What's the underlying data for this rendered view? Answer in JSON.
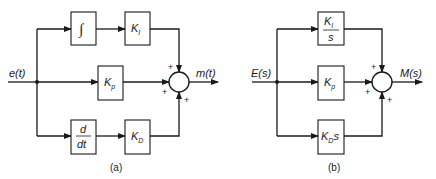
{
  "diagram_a": {
    "caption": "(a)",
    "input_label": "e(t)",
    "output_label": "m(t)",
    "blocks": {
      "integral": {
        "symbol": "∫"
      },
      "ki": {
        "main": "K",
        "sub": "I"
      },
      "kp": {
        "main": "K",
        "sub": "p"
      },
      "derivative": {
        "num": "d",
        "den": "dt"
      },
      "kd": {
        "main": "K",
        "sub": "D"
      }
    },
    "summing_junction": {
      "signs": [
        "+",
        "+",
        "+"
      ]
    }
  },
  "diagram_b": {
    "caption": "(b)",
    "input_label": "E(s)",
    "output_label": "M(s)",
    "blocks": {
      "ki_over_s": {
        "num_main": "K",
        "num_sub": "I",
        "den": "s"
      },
      "kp": {
        "main": "K",
        "sub": "p"
      },
      "kd_s": {
        "main": "K",
        "sub": "D",
        "suffix": "s"
      }
    },
    "summing_junction": {
      "signs": [
        "+",
        "+",
        "+"
      ]
    }
  }
}
